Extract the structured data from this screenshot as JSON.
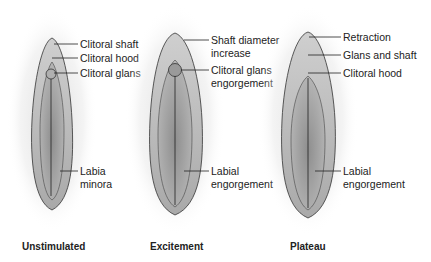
{
  "figure": {
    "panels": [
      {
        "caption": "Unstimulated",
        "labels": [
          "Clitoral shaft",
          "Clitoral hood",
          "Clitoral glans",
          "Labia",
          "minora"
        ]
      },
      {
        "caption": "Excitement",
        "labels": [
          "Shaft diameter",
          "increase",
          "Clitoral glans",
          "engorgement",
          "Labial",
          "engorgement"
        ]
      },
      {
        "caption": "Plateau",
        "labels": [
          "Retraction",
          "Glans and shaft",
          "Clitoral hood",
          "Labial",
          "engorgement"
        ]
      }
    ]
  }
}
